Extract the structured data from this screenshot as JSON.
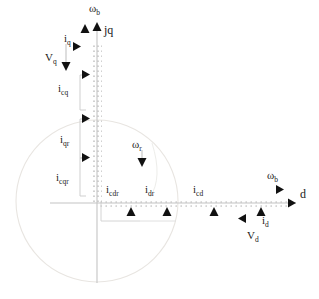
{
  "diagram": {
    "type": "phasor-diagram",
    "title": "",
    "colors": {
      "axis": "#b9b9b9",
      "circle": "#e2e0dc",
      "bracket": "#c9c9c9",
      "marker": "#111111",
      "text": "#1a1a1a",
      "background": "#ffffff"
    },
    "geometry": {
      "origin_x": 97,
      "origin_y": 203,
      "circle_center_x": 97,
      "circle_center_y": 201,
      "circle_radius": 81,
      "d_axis_end_x": 296,
      "q_axis_top_y": 30
    },
    "axes": [
      {
        "name": "d-axis",
        "label": "d",
        "direction": "right",
        "label_x": 300,
        "label_y": 190
      },
      {
        "name": "q-axis",
        "label": "jq",
        "direction": "up",
        "label_x": 104,
        "label_y": 26
      }
    ],
    "angular_speeds": [
      {
        "name": "omega-b-q",
        "label": "ω",
        "sub": "b",
        "x": 90,
        "y": 4,
        "arrow": "up",
        "arrow_x": 97,
        "arrow_y": 26
      },
      {
        "name": "omega-b-d",
        "label": "ω",
        "sub": "b",
        "x": 269,
        "y": 171,
        "arrow": "right",
        "arrow_x": 285,
        "arrow_y": 190
      },
      {
        "name": "omega-r",
        "label": "ω",
        "sub": "r",
        "x": 132,
        "y": 138,
        "arrow": "down",
        "arrow_x": 142,
        "arrow_y": 163
      }
    ],
    "q_axis_components": [
      {
        "name": "i-q",
        "label": "i",
        "sub": "q",
        "x": 64,
        "y": 35,
        "marker": "up",
        "marker_x": 85,
        "marker_y": 29
      },
      {
        "name": "v-q",
        "label": "V",
        "sub": "q",
        "x": 46,
        "y": 54,
        "marker": "down",
        "marker_x": 66,
        "marker_y": 67
      },
      {
        "name": "i-cq",
        "label": "i",
        "sub": "cq",
        "x": 60,
        "y": 81,
        "marker": "right",
        "marker_x": 86,
        "marker_y": 75
      },
      {
        "name": "i-qr",
        "label": "i",
        "sub": "qr",
        "x": 61,
        "y": 132,
        "marker": "right",
        "marker_x": 86,
        "marker_y": 119
      },
      {
        "name": "i-cqr",
        "label": "i",
        "sub": "cqr",
        "x": 58,
        "y": 170,
        "marker": "right",
        "marker_x": 86,
        "marker_y": 158
      }
    ],
    "d_axis_components": [
      {
        "name": "i-cdr",
        "label": "i",
        "sub": "cdr",
        "x": 106,
        "y": 183,
        "marker": "up",
        "marker_x": 131,
        "marker_y": 204
      },
      {
        "name": "i-dr",
        "label": "i",
        "sub": "dr",
        "x": 144,
        "y": 183,
        "marker": "up",
        "marker_x": 167,
        "marker_y": 204
      },
      {
        "name": "i-cd",
        "label": "i",
        "sub": "cd",
        "x": 192,
        "y": 183,
        "marker": "up",
        "marker_x": 214,
        "marker_y": 204
      },
      {
        "name": "i-d",
        "label": "i",
        "sub": "d",
        "x": 262,
        "y": 212,
        "marker": "up",
        "marker_x": 261,
        "marker_y": 204
      },
      {
        "name": "v-d",
        "label": "V",
        "sub": "d",
        "x": 248,
        "y": 227,
        "marker": "left",
        "marker_x": 238,
        "marker_y": 216
      }
    ],
    "ticked_segments": [
      {
        "name": "q-axis-ticks",
        "orientation": "vertical",
        "from": 30,
        "to": 203,
        "at": 97
      },
      {
        "name": "d-axis-ticks",
        "orientation": "horizontal",
        "from": 97,
        "to": 296,
        "at": 203
      }
    ],
    "brackets": [
      {
        "name": "bracket-i-cq",
        "x": 80,
        "y_top": 76,
        "y_bottom": 110
      },
      {
        "name": "bracket-i-qr",
        "x": 80,
        "y_top": 120,
        "y_bottom": 158
      },
      {
        "name": "bracket-i-cqr",
        "x": 80,
        "y_top": 158,
        "y_bottom": 195
      },
      {
        "name": "bracket-d-lower",
        "x": 101,
        "y_top": 203,
        "y_bottom": 220
      }
    ]
  }
}
